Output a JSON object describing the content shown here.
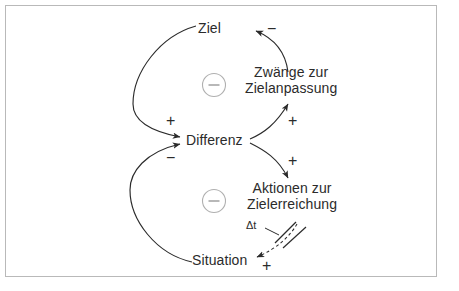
{
  "diagram": {
    "type": "causal-loop-diagram",
    "language": "de",
    "background_color": "#ffffff",
    "border_color": "#b9b9b9",
    "ink_color": "#2b2b2b",
    "loop_marker_color": "#b0b0b0",
    "nodes": [
      {
        "id": "ziel",
        "label": "Ziel"
      },
      {
        "id": "zwaenge",
        "label_line1": "Zwänge zur",
        "label_line2": "Zielanpassung"
      },
      {
        "id": "differenz",
        "label": "Differenz"
      },
      {
        "id": "aktionen",
        "label_line1": "Aktionen zur",
        "label_line2": "Zielerreichung"
      },
      {
        "id": "situation",
        "label": "Situation"
      }
    ],
    "links": [
      {
        "id": "ziel-to-differenz",
        "from": "ziel",
        "to": "differenz",
        "polarity": "+"
      },
      {
        "id": "situation-to-differenz",
        "from": "situation",
        "to": "differenz",
        "polarity": "−"
      },
      {
        "id": "differenz-to-zwaenge",
        "from": "differenz",
        "to": "zwaenge",
        "polarity": "+"
      },
      {
        "id": "differenz-to-aktionen",
        "from": "differenz",
        "to": "aktionen",
        "polarity": "+"
      },
      {
        "id": "zwaenge-to-ziel",
        "from": "zwaenge",
        "to": "ziel",
        "polarity": "−"
      },
      {
        "id": "aktionen-to-situation",
        "from": "aktionen",
        "to": "situation",
        "polarity": "+",
        "delayed": true,
        "delay_label": "Δt"
      }
    ],
    "loop_markers": [
      {
        "id": "upper-loop",
        "polarity": "−"
      },
      {
        "id": "lower-loop",
        "polarity": "−"
      }
    ]
  }
}
